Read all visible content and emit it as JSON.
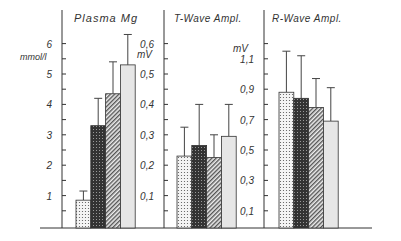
{
  "chart_data": [
    {
      "type": "bar",
      "title": "Plasma Mg",
      "ylabel": "mmol/l",
      "ylim": [
        0,
        6.5
      ],
      "yticks_labeled": [
        "1",
        "2",
        "3",
        "4",
        "5",
        "6"
      ],
      "categories": [
        "Group 1",
        "Group 2",
        "Group 3",
        "Group 4"
      ],
      "values": [
        0.85,
        3.3,
        4.35,
        5.3
      ],
      "error_upper": [
        1.15,
        4.2,
        5.4,
        6.3
      ],
      "patterns": [
        "dotted",
        "dark-crosshatch",
        "diagonal-hatch",
        "light-gray"
      ]
    },
    {
      "type": "bar",
      "title": "T-Wave Ampl.",
      "ylabel": "mV",
      "ylim": [
        0,
        0.65
      ],
      "yticks_labeled": [
        "0,1",
        "0,2",
        "0,3",
        "0,4",
        "0,5",
        "0,6"
      ],
      "categories": [
        "Group 1",
        "Group 2",
        "Group 3",
        "Group 4"
      ],
      "values": [
        0.23,
        0.265,
        0.225,
        0.295
      ],
      "error_upper": [
        0.325,
        0.4,
        0.3,
        0.4
      ],
      "patterns": [
        "dotted",
        "dark-crosshatch",
        "diagonal-hatch",
        "light-gray"
      ]
    },
    {
      "type": "bar",
      "title": "R-Wave Ampl.",
      "ylabel": "mV",
      "ylim": [
        0,
        1.3
      ],
      "yticks_labeled": [
        "0,1",
        "0,3",
        "0,5",
        "0,7",
        "0,9",
        "1,1"
      ],
      "categories": [
        "Group 1",
        "Group 2",
        "Group 3",
        "Group 4"
      ],
      "values": [
        0.88,
        0.84,
        0.78,
        0.69
      ],
      "error_upper": [
        1.15,
        1.12,
        0.97,
        0.91
      ],
      "patterns": [
        "dotted",
        "dark-crosshatch",
        "diagonal-hatch",
        "light-gray"
      ]
    }
  ],
  "panels": [
    {
      "title": "Plasma Mg",
      "unit": "mmol/l",
      "ticks": [
        "1",
        "2",
        "3",
        "4",
        "5",
        "6"
      ]
    },
    {
      "title": "T-Wave Ampl.",
      "unit": "mV",
      "ticks": [
        "0,1",
        "0,2",
        "0,3",
        "0,4",
        "0,5",
        "0,6"
      ]
    },
    {
      "title": "R-Wave Ampl.",
      "unit": "mV",
      "ticks": [
        "0,1",
        "0,3",
        "0,5",
        "0,7",
        "0,9",
        "1,1"
      ]
    }
  ]
}
